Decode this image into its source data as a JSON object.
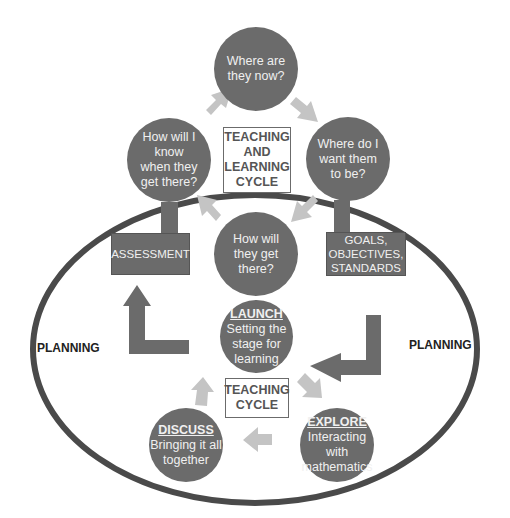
{
  "diagram": {
    "outer_label_left": "PLANNING",
    "outer_label_right": "PLANNING",
    "teaching_learning_cycle": {
      "center_label": [
        "TEACHING",
        "AND",
        "LEARNING",
        "CYCLE"
      ],
      "nodes": [
        {
          "id": "top",
          "lines": [
            "Where are",
            "they now?"
          ]
        },
        {
          "id": "right",
          "lines": [
            "Where do I",
            "want them",
            "to be?"
          ]
        },
        {
          "id": "bottom",
          "lines": [
            "How will",
            "they get",
            "there?"
          ]
        },
        {
          "id": "left",
          "lines": [
            "How will I",
            "know",
            "when they",
            "get there?"
          ]
        }
      ],
      "attached_boxes": {
        "left": "ASSESSMENT",
        "right": [
          "GOALS,",
          "OBJECTIVES,",
          "STANDARDS"
        ]
      }
    },
    "teaching_cycle": {
      "center_label": [
        "TEACHING",
        "CYCLE"
      ],
      "nodes": [
        {
          "id": "launch",
          "title": "LAUNCH",
          "lines": [
            "Setting the",
            "stage for",
            "learning"
          ]
        },
        {
          "id": "explore",
          "title": "EXPLORE",
          "lines": [
            "Interacting",
            "with",
            "mathematics"
          ]
        },
        {
          "id": "discuss",
          "title": "DISCUSS",
          "lines": [
            "Bringing it all",
            "together"
          ]
        }
      ]
    },
    "colors": {
      "node_fill": "#6b6b6b",
      "node_text": "#f0f0f0",
      "small_arrow": "#c4c4c4",
      "ellipse_stroke": "#4a4a4a",
      "background": "#ffffff"
    }
  }
}
